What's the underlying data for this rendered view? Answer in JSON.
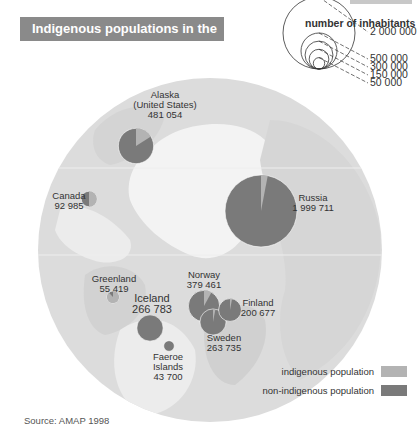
{
  "title": "Indigenous populations in the Arctic",
  "source": "Source: AMAP 1998",
  "colors": {
    "indigenous": "#b3b3b3",
    "non_indigenous": "#7a7a7a",
    "map_land": "#dcdcdc",
    "map_sea": "#f0f0f0",
    "title_bg": "#8a8a8a"
  },
  "chart_data": {
    "type": "proportional-pie-map",
    "title": "Indigenous populations in the Arctic",
    "size_legend": {
      "title": "number of inhabitants",
      "values": [
        "2 000 000",
        "500 000",
        "300 000",
        "150 000",
        "50 000"
      ]
    },
    "color_legend": [
      {
        "label": "indigenous population",
        "key": "indigenous"
      },
      {
        "label": "non-indigenous population",
        "key": "non_indigenous"
      }
    ],
    "regions": [
      {
        "name": "Alaska (United States)",
        "name_lines": [
          "Alaska",
          "(United States)"
        ],
        "population": 481054,
        "population_label": "481 054",
        "indigenous_share": 0.16
      },
      {
        "name": "Canada",
        "name_lines": [
          "Canada"
        ],
        "population": 92985,
        "population_label": "92 985",
        "indigenous_share": 0.5
      },
      {
        "name": "Russia",
        "name_lines": [
          "Russia"
        ],
        "population": 1999711,
        "population_label": "1 999 711",
        "indigenous_share": 0.03
      },
      {
        "name": "Greenland",
        "name_lines": [
          "Greenland"
        ],
        "population": 55419,
        "population_label": "55 419",
        "indigenous_share": 0.88
      },
      {
        "name": "Iceland",
        "name_lines": [
          "Iceland"
        ],
        "population": 266783,
        "population_label": "266 783",
        "indigenous_share": 0.0
      },
      {
        "name": "Faeroe Islands",
        "name_lines": [
          "Faeroe",
          "Islands"
        ],
        "population": 43700,
        "population_label": "43 700",
        "indigenous_share": 0.0
      },
      {
        "name": "Norway",
        "name_lines": [
          "Norway"
        ],
        "population": 379461,
        "population_label": "379 461",
        "indigenous_share": 0.08
      },
      {
        "name": "Sweden",
        "name_lines": [
          "Sweden"
        ],
        "population": 263735,
        "population_label": "263 735",
        "indigenous_share": 0.03
      },
      {
        "name": "Finland",
        "name_lines": [
          "Finland"
        ],
        "population": 200677,
        "population_label": "200 677",
        "indigenous_share": 0.03
      }
    ]
  }
}
